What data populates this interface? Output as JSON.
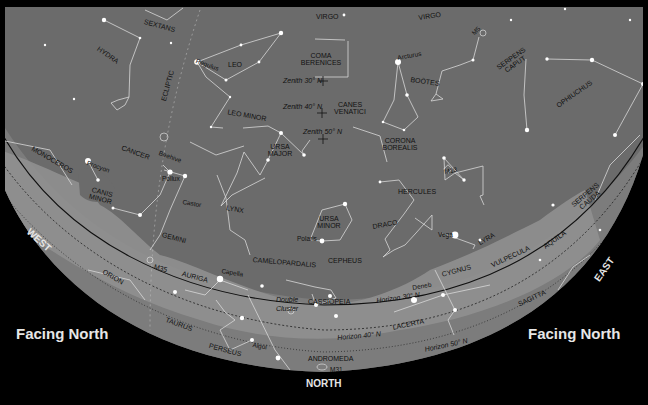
{
  "chart_title": "Facing North",
  "facing_labels": {
    "left": "Facing North",
    "right": "Facing North"
  },
  "cardinal": {
    "west": "WEST",
    "east": "EAST",
    "north": "NORTH"
  },
  "colors": {
    "background": "#000000",
    "sky": "#6b6b6b",
    "milky_way": "#8c8c8c",
    "below_horizon": "#7a7a7a",
    "lines": "#d8d8d8",
    "stars": "#ffffff",
    "label_text": "#111111",
    "heading_text": "#e6e6e6"
  },
  "zenith_markers": [
    {
      "label": "Zenith 30° N",
      "x": 323,
      "y": 80
    },
    {
      "label": "Zenith 40° N",
      "x": 322,
      "y": 112
    },
    {
      "label": "Zenith 50° N",
      "x": 323,
      "y": 138
    }
  ],
  "horizon_lines": [
    {
      "label": "Horizon 30° N"
    },
    {
      "label": "Horizon 40° N"
    },
    {
      "label": "Horizon 50° N"
    }
  ],
  "constellations": [
    {
      "name": "SEXTANS",
      "x": 145,
      "y": 18,
      "rot": 15
    },
    {
      "name": "VIRGO",
      "x": 316,
      "y": 13,
      "rot": 0
    },
    {
      "name": "VIRGO",
      "x": 418,
      "y": 14,
      "rot": -8
    },
    {
      "name": "HYDRA",
      "x": 100,
      "y": 45,
      "rot": 35
    },
    {
      "name": "LEO",
      "x": 228,
      "y": 61,
      "rot": 0
    },
    {
      "name": "COMA BERENICES",
      "x": 305,
      "y": 52,
      "rot": 0
    },
    {
      "name": "BOÖTES",
      "x": 411,
      "y": 76,
      "rot": 8
    },
    {
      "name": "SERPENS CAPUT",
      "x": 497,
      "y": 68,
      "rot": -35
    },
    {
      "name": "OPHIUCHUS",
      "x": 555,
      "y": 103,
      "rot": -35
    },
    {
      "name": "ECLIPTIC",
      "x": 160,
      "y": 100,
      "rot": -75
    },
    {
      "name": "LEO MINOR",
      "x": 232,
      "y": 108,
      "rot": 10
    },
    {
      "name": "CANES VENATICI",
      "x": 334,
      "y": 101,
      "rot": 0
    },
    {
      "name": "URSA MAJOR",
      "x": 264,
      "y": 143,
      "rot": 0
    },
    {
      "name": "CORONA BOREALIS",
      "x": 384,
      "y": 137,
      "rot": 0
    },
    {
      "name": "MONOCEROS",
      "x": 34,
      "y": 145,
      "rot": 30
    },
    {
      "name": "CANCER",
      "x": 123,
      "y": 144,
      "rot": 20
    },
    {
      "name": "CANIS MINOR",
      "x": 88,
      "y": 183,
      "rot": 15
    },
    {
      "name": "HERCULES",
      "x": 398,
      "y": 188,
      "rot": 0
    },
    {
      "name": "LYNX",
      "x": 227,
      "y": 204,
      "rot": 10
    },
    {
      "name": "URSA MINOR",
      "x": 313,
      "y": 215,
      "rot": 0
    },
    {
      "name": "DRACO",
      "x": 372,
      "y": 223,
      "rot": -10
    },
    {
      "name": "GEMINI",
      "x": 163,
      "y": 231,
      "rot": 15
    },
    {
      "name": "SERPENS CAUDA",
      "x": 572,
      "y": 206,
      "rot": -40
    },
    {
      "name": "CEPHEUS",
      "x": 328,
      "y": 257,
      "rot": 0
    },
    {
      "name": "CAMELOPARDALIS",
      "x": 253,
      "y": 256,
      "rot": 5
    },
    {
      "name": "LYRA",
      "x": 477,
      "y": 240,
      "rot": -30
    },
    {
      "name": "M35",
      "x": 155,
      "y": 263,
      "rot": 15
    },
    {
      "name": "AURIGA",
      "x": 183,
      "y": 270,
      "rot": 15
    },
    {
      "name": "ORION",
      "x": 105,
      "y": 268,
      "rot": 30
    },
    {
      "name": "CYGNUS",
      "x": 441,
      "y": 271,
      "rot": -15
    },
    {
      "name": "VULPECULA",
      "x": 490,
      "y": 262,
      "rot": -25
    },
    {
      "name": "AQUILA",
      "x": 542,
      "y": 244,
      "rot": -35
    },
    {
      "name": "CASSIOPEIA",
      "x": 308,
      "y": 298,
      "rot": 0
    },
    {
      "name": "TAURUS",
      "x": 167,
      "y": 316,
      "rot": 20
    },
    {
      "name": "SAGITTA",
      "x": 517,
      "y": 301,
      "rot": -25
    },
    {
      "name": "LACERTA",
      "x": 392,
      "y": 324,
      "rot": -12
    },
    {
      "name": "PERSEUS",
      "x": 210,
      "y": 342,
      "rot": 15
    },
    {
      "name": "ANDROMEDA",
      "x": 308,
      "y": 355,
      "rot": 0
    }
  ],
  "stars": [
    {
      "name": "Regulus",
      "x": 197,
      "y": 58,
      "rot": 20
    },
    {
      "name": "Arcturus",
      "x": 397,
      "y": 55,
      "rot": -10
    },
    {
      "name": "Procyon",
      "x": 88,
      "y": 160,
      "rot": 20
    },
    {
      "name": "Beehive",
      "x": 160,
      "y": 150,
      "rot": 20
    },
    {
      "name": "Pollux",
      "x": 162,
      "y": 176,
      "rot": 0
    },
    {
      "name": "Castor",
      "x": 183,
      "y": 199,
      "rot": 10
    },
    {
      "name": "Polaris",
      "x": 297,
      "y": 236,
      "rot": 0
    },
    {
      "name": "Vega",
      "x": 438,
      "y": 232,
      "rot": 0
    },
    {
      "name": "Capella",
      "x": 222,
      "y": 268,
      "rot": 10
    },
    {
      "name": "Deneb",
      "x": 412,
      "y": 285,
      "rot": -10
    },
    {
      "name": "Algol",
      "x": 253,
      "y": 342,
      "rot": 10
    },
    {
      "name": "M13",
      "x": 444,
      "y": 169,
      "rot": -10
    },
    {
      "name": "M5",
      "x": 471,
      "y": 32,
      "rot": -45
    },
    {
      "name": "M31",
      "x": 330,
      "y": 367,
      "rot": 0
    }
  ],
  "italic_labels": [
    {
      "text": "Double",
      "x": 276,
      "y": 296
    },
    {
      "text": "Cluster",
      "x": 276,
      "y": 305
    },
    {
      "text": "Horizon 30° N",
      "x": 376,
      "y": 297,
      "rot": -8
    },
    {
      "text": "Horizon 40° N",
      "x": 337,
      "y": 334,
      "rot": -5
    },
    {
      "text": "Horizon 50° N",
      "x": 424,
      "y": 346,
      "rot": -12
    }
  ]
}
